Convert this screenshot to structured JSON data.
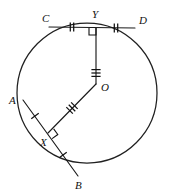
{
  "figure": {
    "background_color": "#ffffff",
    "ink_color": "#111111"
  },
  "circle": {
    "name": "main-circle",
    "center_label": "O",
    "center_x": 87,
    "center_y": 93,
    "radius": 70,
    "stroke_color": "#202020"
  },
  "points": [
    {
      "id": "C",
      "label": "C",
      "x": 49,
      "y": 27,
      "label_x": 42,
      "label_y": 13,
      "on_circle": true
    },
    {
      "id": "D",
      "label": "D",
      "x": 135,
      "y": 28,
      "label_x": 139,
      "label_y": 15,
      "on_circle": true
    },
    {
      "id": "Y",
      "label": "Y",
      "x": 96,
      "y": 28,
      "label_x": 92,
      "label_y": 9,
      "on_circle": false
    },
    {
      "id": "O",
      "label": "O",
      "x": 96,
      "y": 84,
      "label_x": 101,
      "label_y": 82,
      "on_circle": false
    },
    {
      "id": "A",
      "label": "A",
      "x": 23,
      "y": 100,
      "label_x": 9,
      "label_y": 95,
      "on_circle": true
    },
    {
      "id": "X",
      "label": "X",
      "x": 48,
      "y": 133,
      "label_x": 40,
      "label_y": 137,
      "on_circle": false
    },
    {
      "id": "B",
      "label": "B",
      "x": 78,
      "y": 176,
      "label_x": 75,
      "label_y": 180,
      "on_circle": true
    }
  ],
  "segments": [
    {
      "id": "CD",
      "name": "chord-cd",
      "from": "C",
      "to": "D",
      "kind": "chord"
    },
    {
      "id": "AB",
      "name": "chord-ab",
      "from": "A",
      "to": "B",
      "kind": "chord"
    },
    {
      "id": "OY",
      "name": "segment-oy",
      "from": "O",
      "to": "Y",
      "kind": "radius-to-midpoint"
    },
    {
      "id": "OX",
      "name": "segment-ox",
      "from": "O",
      "to": "X",
      "kind": "radius-to-midpoint"
    }
  ],
  "tick_marks": [
    {
      "id": "CY",
      "name": "tick-cy",
      "segment": "CD",
      "count": 2,
      "center_x": 72,
      "center_y": 27,
      "angle_deg": 0,
      "note": "congruent half-chord C to Y"
    },
    {
      "id": "YD",
      "name": "tick-yd",
      "segment": "CD",
      "count": 2,
      "center_x": 116,
      "center_y": 28,
      "angle_deg": 0,
      "note": "congruent half-chord Y to D"
    },
    {
      "id": "AX",
      "name": "tick-ax",
      "segment": "AB",
      "count": 1,
      "center_x": 35,
      "center_y": 116,
      "angle_deg": 54,
      "note": "congruent half-chord A to X"
    },
    {
      "id": "XB",
      "name": "tick-xb",
      "segment": "AB",
      "count": 1,
      "center_x": 63,
      "center_y": 155,
      "angle_deg": 54,
      "note": "congruent half-chord X to B"
    },
    {
      "id": "OY3",
      "name": "tick-oy",
      "segment": "OY",
      "count": 3,
      "center_x": 96,
      "center_y": 73,
      "angle_deg": 90,
      "note": "equal distance from centre"
    },
    {
      "id": "OX3",
      "name": "tick-ox",
      "segment": "OX",
      "count": 3,
      "center_x": 72,
      "center_y": 108,
      "angle_deg": -45,
      "note": "equal distance from centre"
    }
  ],
  "right_angles": [
    {
      "id": "at-Y",
      "name": "right-angle-y",
      "vertex": "Y",
      "x": 96,
      "y": 28,
      "size": 7,
      "dir_x": -1,
      "dir_y": 1,
      "note": "OY perpendicular to CD"
    },
    {
      "id": "at-X",
      "name": "right-angle-x",
      "vertex": "X",
      "x": 48,
      "y": 133,
      "size": 7,
      "angle_deg": 54,
      "note": "OX perpendicular to AB"
    }
  ],
  "labels": {
    "C": "C",
    "D": "D",
    "Y": "Y",
    "O": "O",
    "A": "A",
    "X": "X",
    "B": "B"
  }
}
